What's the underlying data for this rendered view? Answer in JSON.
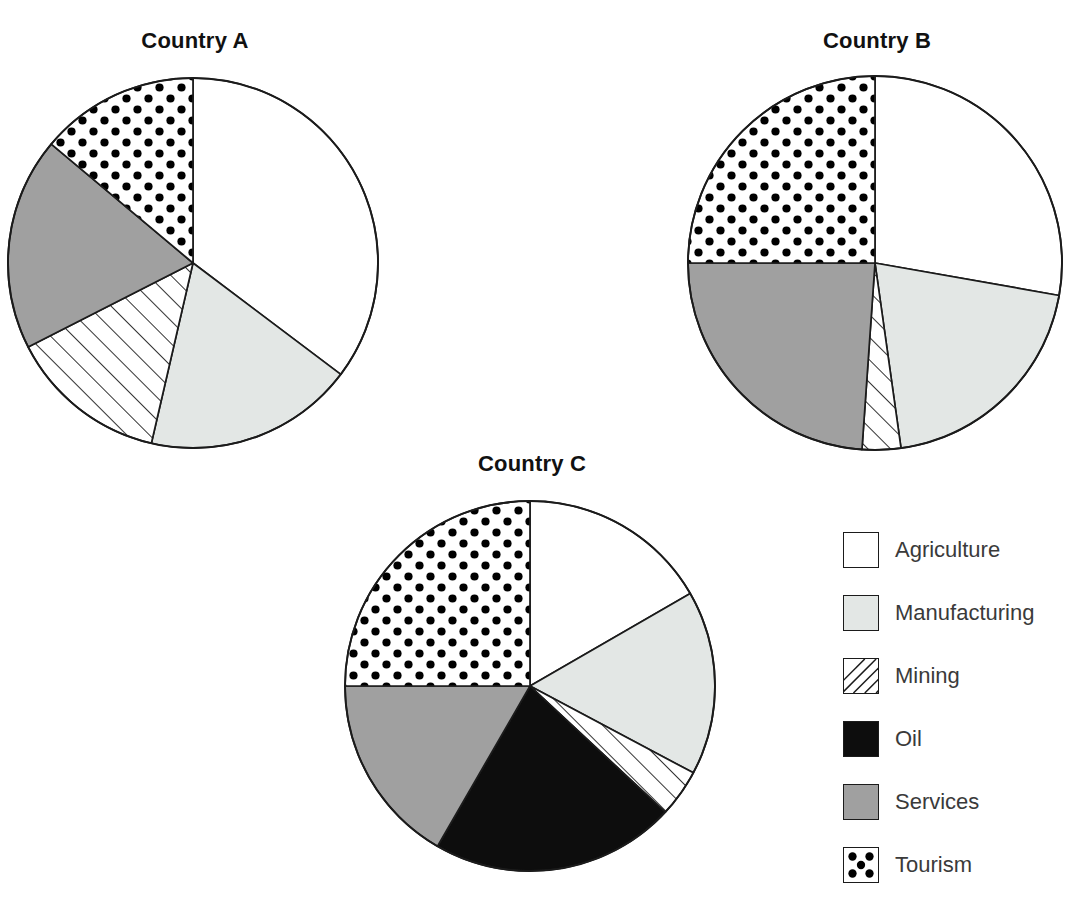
{
  "chart_data": {
    "type": "pie",
    "title": "",
    "categories": [
      "Agriculture",
      "Manufacturing",
      "Mining",
      "Oil",
      "Services",
      "Tourism"
    ],
    "legend_position": "right",
    "charts": [
      {
        "title": "Country A",
        "center": [
          193,
          265
        ],
        "radius": 185,
        "slices": [
          {
            "label": "Agriculture",
            "percent": 35,
            "start_deg": 0,
            "end_deg": 127
          },
          {
            "label": "Manufacturing",
            "percent": 18,
            "start_deg": 127,
            "end_deg": 193
          },
          {
            "label": "Mining",
            "percent": 14,
            "start_deg": 193,
            "end_deg": 243
          },
          {
            "label": "Services",
            "percent": 19,
            "start_deg": 243,
            "end_deg": 310
          },
          {
            "label": "Tourism",
            "percent": 14,
            "start_deg": 310,
            "end_deg": 360
          }
        ]
      },
      {
        "title": "Country B",
        "center": [
          875,
          265
        ],
        "radius": 187,
        "slices": [
          {
            "label": "Agriculture",
            "percent": 28,
            "start_deg": 0,
            "end_deg": 100
          },
          {
            "label": "Manufacturing",
            "percent": 20,
            "start_deg": 100,
            "end_deg": 172
          },
          {
            "label": "Mining",
            "percent": 3,
            "start_deg": 172,
            "end_deg": 184
          },
          {
            "label": "Services",
            "percent": 24,
            "start_deg": 184,
            "end_deg": 270
          },
          {
            "label": "Tourism",
            "percent": 25,
            "start_deg": 270,
            "end_deg": 360
          }
        ]
      },
      {
        "title": "Country C",
        "center": [
          530,
          688
        ],
        "radius": 185,
        "slices": [
          {
            "label": "Agriculture",
            "percent": 17,
            "start_deg": 0,
            "end_deg": 60
          },
          {
            "label": "Manufacturing",
            "percent": 16,
            "start_deg": 60,
            "end_deg": 118
          },
          {
            "label": "Mining",
            "percent": 4,
            "start_deg": 118,
            "end_deg": 133
          },
          {
            "label": "Oil",
            "percent": 21,
            "start_deg": 133,
            "end_deg": 210
          },
          {
            "label": "Services",
            "percent": 17,
            "start_deg": 210,
            "end_deg": 270
          },
          {
            "label": "Tourism",
            "percent": 25,
            "start_deg": 270,
            "end_deg": 360
          }
        ]
      }
    ]
  },
  "titles": {
    "country_a": "Country A",
    "country_b": "Country B",
    "country_c": "Country C"
  },
  "legend": {
    "items": [
      {
        "label": "Agriculture",
        "fill": "solid",
        "color": "#ffffff",
        "swatch_name": "legend-swatch-agriculture"
      },
      {
        "label": "Manufacturing",
        "fill": "solid",
        "color": "#e3e7e5",
        "swatch_name": "legend-swatch-manufacturing"
      },
      {
        "label": "Mining",
        "fill": "hatch",
        "color": "#ffffff",
        "swatch_name": "legend-swatch-mining"
      },
      {
        "label": "Oil",
        "fill": "solid",
        "color": "#0d0d0d",
        "swatch_name": "legend-swatch-oil"
      },
      {
        "label": "Services",
        "fill": "solid",
        "color": "#a0a0a0",
        "swatch_name": "legend-swatch-services"
      },
      {
        "label": "Tourism",
        "fill": "dots",
        "color": "#ffffff",
        "swatch_name": "legend-swatch-tourism"
      }
    ]
  },
  "colors": {
    "agriculture": "#ffffff",
    "manufacturing": "#e3e7e5",
    "mining": "#ffffff",
    "oil": "#0d0d0d",
    "services": "#a0a0a0",
    "tourism": "#ffffff",
    "outline": "#1b1b1b",
    "text": "#111111",
    "legend_text": "#3a3a3a"
  }
}
